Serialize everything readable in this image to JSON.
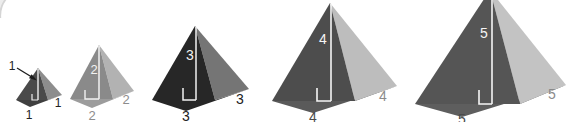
{
  "figure": {
    "background_color": "#ffffff",
    "width": 576,
    "height": 122,
    "corner_arc": {
      "name": "top-left-corner-arc",
      "color": "#d8d8d8",
      "description": "faint rounded corner arc of an overlapping panel"
    }
  },
  "pyramids": [
    {
      "id": 1,
      "height_label": "1",
      "base_label": "1",
      "slant_label": "1",
      "left_face_color": "#4a4a4a",
      "right_face_color": "#8d8d8d",
      "base_color": "#3c3c3c",
      "height_line_color": "#e8e8e8",
      "right_angle_color": "#e8e8e8",
      "height_label_color": "#222222",
      "base_label_color": "#222222",
      "slant_label_color": "#222222",
      "has_leader_arrow": true,
      "leader_arrow_color": "#1c1c1c",
      "apex": [
        38,
        68
      ],
      "base_left": [
        16,
        100
      ],
      "base_right": [
        48,
        100
      ],
      "base_front": [
        30,
        106
      ],
      "base_back_right": [
        62,
        94
      ]
    },
    {
      "id": 2,
      "height_label": "2",
      "base_label": "2",
      "slant_label": "2",
      "left_face_color": "#8a8a8a",
      "right_face_color": "#b2b2b2",
      "base_color": "#9a9a9a",
      "height_line_color": "#f2f2f2",
      "right_angle_color": "#f2f2f2",
      "height_label_color": "#f2f2f2",
      "base_label_color": "#8c8c8c",
      "slant_label_color": "#8c8c8c",
      "has_leader_arrow": false,
      "apex": [
        99,
        45
      ],
      "base_left": [
        70,
        99
      ],
      "base_right": [
        113,
        99
      ],
      "base_front": [
        92,
        107
      ],
      "base_back_right": [
        134,
        90
      ]
    },
    {
      "id": 3,
      "height_label": "3",
      "base_label": "3",
      "slant_label": "3",
      "left_face_color": "#272727",
      "right_face_color": "#757575",
      "base_color": "#262626",
      "height_line_color": "#f2f2f2",
      "right_angle_color": "#f2f2f2",
      "height_label_color": "#f2f2f2",
      "base_label_color": "#222222",
      "slant_label_color": "#222222",
      "has_leader_arrow": false,
      "apex": [
        195,
        26
      ],
      "base_left": [
        152,
        100
      ],
      "base_right": [
        215,
        100
      ],
      "base_front": [
        186,
        110
      ],
      "base_back_right": [
        249,
        88
      ]
    },
    {
      "id": 4,
      "height_label": "4",
      "base_label": "4",
      "slant_label": "4",
      "left_face_color": "#4d4d4d",
      "right_face_color": "#bdbdbd",
      "base_color": "#5a5a5a",
      "height_line_color": "#f5f5f5",
      "right_angle_color": "#f5f5f5",
      "height_label_color": "#f5f5f5",
      "base_label_color": "#4a4a4a",
      "slant_label_color": "#8a8a8a",
      "has_leader_arrow": false,
      "apex": [
        330,
        3
      ],
      "base_left": [
        272,
        101
      ],
      "base_right": [
        355,
        101
      ],
      "base_front": [
        313,
        112
      ],
      "base_back_right": [
        397,
        85
      ]
    },
    {
      "id": 5,
      "height_label": "5",
      "base_label": "5",
      "slant_label": "5",
      "left_face_color": "#555555",
      "right_face_color": "#c3c3c3",
      "base_color": "#5e5e5e",
      "height_line_color": "#f5f5f5",
      "right_angle_color": "#f5f5f5",
      "height_label_color": "#f5f5f5",
      "base_label_color": "#4a4a4a",
      "slant_label_color": "#8a8a8a",
      "has_leader_arrow": false,
      "apex": [
        490,
        -8
      ],
      "base_left": [
        415,
        104
      ],
      "base_right": [
        520,
        104
      ],
      "base_front": [
        462,
        116
      ],
      "base_back_right": [
        566,
        84
      ]
    }
  ]
}
